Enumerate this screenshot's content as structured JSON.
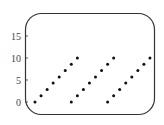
{
  "chart_data": {
    "type": "scatter",
    "title": "",
    "xlabel": "",
    "ylabel": "",
    "ylim": [
      0,
      17
    ],
    "y_ticks": [
      0,
      5,
      10,
      15
    ],
    "x_ticks": [],
    "grid": false,
    "legend": null,
    "series": [
      {
        "name": "sawtooth",
        "x": [
          1,
          2,
          3,
          4,
          5,
          6,
          7,
          8,
          7,
          8,
          9,
          10,
          11,
          12,
          13,
          14,
          13,
          14,
          15,
          16,
          17,
          18,
          19,
          20
        ],
        "y": [
          0,
          1.43,
          2.86,
          4.29,
          5.71,
          7.14,
          8.57,
          10,
          0,
          1.43,
          2.86,
          4.29,
          5.71,
          7.14,
          8.57,
          10,
          0,
          1.43,
          2.86,
          4.29,
          5.71,
          7.14,
          8.57,
          10
        ]
      }
    ]
  },
  "axis": {
    "y_labels": [
      "0",
      "5",
      "10",
      "15"
    ]
  },
  "colors": {
    "frame": "#333333",
    "dot": "#111111",
    "text": "#444444"
  }
}
